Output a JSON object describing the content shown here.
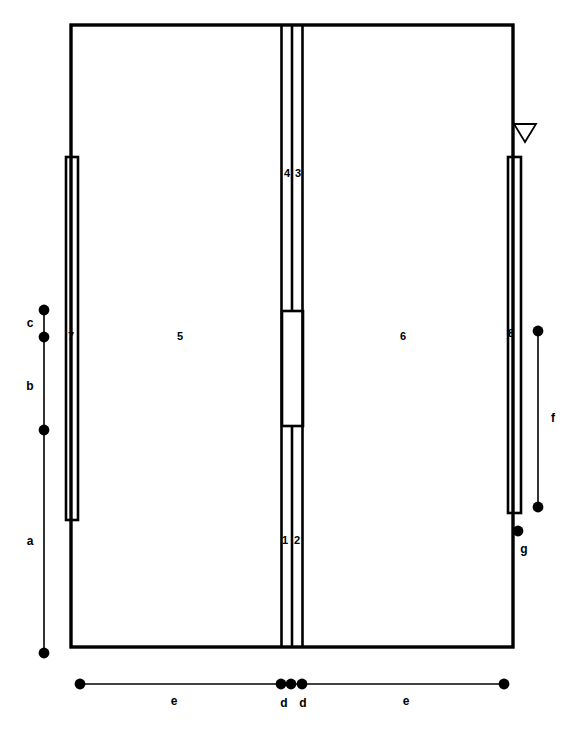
{
  "figure": {
    "type": "technical-line-drawing",
    "background_color": "#ffffff",
    "line_color": "#000000",
    "width": 579,
    "height": 730
  },
  "part_labels": [
    {
      "id": "part-1",
      "text": "1",
      "x": 285,
      "y": 544
    },
    {
      "id": "part-2",
      "text": "2",
      "x": 297,
      "y": 544
    },
    {
      "id": "part-3",
      "text": "3",
      "x": 298,
      "y": 177
    },
    {
      "id": "part-4",
      "text": "4",
      "x": 287,
      "y": 177
    },
    {
      "id": "part-5",
      "text": "5",
      "x": 180,
      "y": 340
    },
    {
      "id": "part-6",
      "text": "6",
      "x": 403,
      "y": 340
    },
    {
      "id": "part-7",
      "text": "7",
      "x": 71,
      "y": 340
    },
    {
      "id": "part-8",
      "text": "8",
      "x": 511,
      "y": 337
    }
  ],
  "dimension_labels": [
    {
      "id": "dim-a",
      "text": "a",
      "x": 30,
      "y": 545
    },
    {
      "id": "dim-b",
      "text": "b",
      "x": 30,
      "y": 390
    },
    {
      "id": "dim-c",
      "text": "c",
      "x": 30,
      "y": 327
    },
    {
      "id": "dim-d-left",
      "text": "d",
      "x": 284,
      "y": 707
    },
    {
      "id": "dim-d-right",
      "text": "d",
      "x": 303,
      "y": 707
    },
    {
      "id": "dim-e-left",
      "text": "e",
      "x": 174,
      "y": 705
    },
    {
      "id": "dim-e-right",
      "text": "e",
      "x": 406,
      "y": 705
    },
    {
      "id": "dim-f",
      "text": "f",
      "x": 553,
      "y": 422
    },
    {
      "id": "dim-g",
      "text": "g",
      "x": 524,
      "y": 553
    }
  ],
  "geometry": {
    "outer_body": {
      "x": 71,
      "y": 25,
      "width": 442,
      "height": 622,
      "stroke_width": 3.4
    },
    "left_bar": {
      "x": 66,
      "y": 157,
      "width": 12,
      "height": 363,
      "stroke_width": 2.6
    },
    "right_bar": {
      "x": 508,
      "y": 157,
      "width": 13,
      "height": 356,
      "stroke_width": 2.6
    },
    "center_rails": [
      {
        "id": "rail-left",
        "x": 281.5,
        "stroke_width": 2.6
      },
      {
        "id": "rail-mid",
        "x": 292.0,
        "stroke_width": 2.6
      },
      {
        "id": "rail-right",
        "x": 302.5,
        "stroke_width": 2.6
      }
    ],
    "center_span": {
      "top": 25,
      "bottom": 647
    },
    "center_block_upper": {
      "x": 282,
      "y": 311,
      "width": 21,
      "height": 115,
      "stroke_width": 2.6
    },
    "center_gap_upper_y": 311,
    "center_gap_lower_y": 426,
    "marker_triangle": {
      "cx": 525,
      "cy": 133,
      "half_width": 11,
      "height": 18,
      "stroke_width": 1.8
    }
  },
  "dimension_lines": {
    "left": {
      "x": 44,
      "dots": [
        310,
        337,
        430,
        653
      ],
      "segments": [
        {
          "label": "c",
          "from": 310,
          "to": 337
        },
        {
          "label": "b",
          "from": 337,
          "to": 430
        },
        {
          "label": "a",
          "from": 430,
          "to": 653
        }
      ]
    },
    "right_f": {
      "x": 538,
      "dots": [
        331,
        507
      ],
      "segments": [
        {
          "label": "f",
          "from": 331,
          "to": 507
        }
      ]
    },
    "right_g": {
      "x": 518,
      "dots": [
        531
      ]
    },
    "bottom": {
      "y": 684,
      "dots": [
        80,
        281,
        291,
        302,
        504
      ],
      "segments": [
        {
          "label": "e",
          "from": 80,
          "to": 281
        },
        {
          "label": "d",
          "from": 281,
          "to": 291
        },
        {
          "label": "d",
          "from": 291,
          "to": 302
        },
        {
          "label": "e",
          "from": 302,
          "to": 504
        }
      ]
    },
    "dot_radius": 5.4
  }
}
